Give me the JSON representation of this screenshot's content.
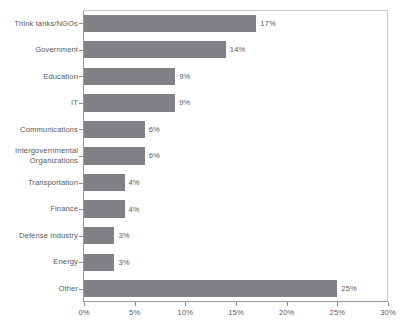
{
  "chart_data": {
    "type": "bar",
    "orientation": "horizontal",
    "title": "",
    "subtitle": "",
    "xlabel": "",
    "ylabel": "",
    "xlim": [
      0,
      30
    ],
    "grid": false,
    "legend": null,
    "bar_color": "#808184",
    "axis_color": "#8e8e8e",
    "text_color": "#58595b",
    "categories": [
      "Think tanks/NGOs",
      "Government",
      "Education",
      "IT",
      "Communications",
      "Intergovernmental\nOrganizations",
      "Transportation",
      "Finance",
      "Defense Industry",
      "Energy",
      "Other"
    ],
    "values": [
      17,
      14,
      9,
      9,
      6,
      6,
      4,
      4,
      3,
      3,
      25
    ],
    "data_labels": [
      "17%",
      "14%",
      "9%",
      "9%",
      "6%",
      "6%",
      "4%",
      "4%",
      "3%",
      "3%",
      "25%"
    ],
    "xticks": [
      0,
      5,
      10,
      15,
      20,
      25,
      30
    ],
    "xtick_labels": [
      "0%",
      "5%",
      "10%",
      "15%",
      "20%",
      "25%",
      "30%"
    ]
  }
}
